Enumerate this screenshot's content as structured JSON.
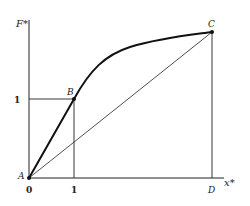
{
  "diagram": {
    "axes": {
      "y_label": "F*",
      "x_label": "x*",
      "origin_label": "0"
    },
    "ticks": {
      "x_tick": "1",
      "y_tick": "1"
    },
    "points": {
      "A": "A",
      "B": "B",
      "C": "C",
      "D": "D"
    },
    "colors": {
      "stroke": "#222222",
      "background": "#ffffff"
    }
  }
}
